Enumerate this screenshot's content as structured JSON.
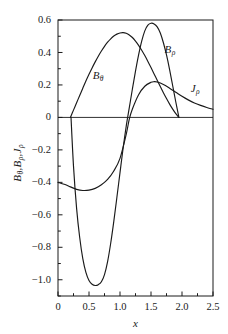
{
  "chart_data": {
    "type": "line",
    "title": "",
    "xlabel": "x",
    "ylabel": "Bθ, Bρ, Jρ",
    "xlim": [
      0,
      2.5
    ],
    "ylim": [
      -1.1,
      0.6
    ],
    "grid": false,
    "legend_position": "inline-annotations",
    "xticks": [
      "0",
      "0.5",
      "1.0",
      "1.5",
      "2.0",
      "2.5"
    ],
    "xtick_values": [
      0,
      0.5,
      1.0,
      1.5,
      2.0,
      2.5
    ],
    "yticks": [
      "0.6",
      "0.4",
      "0.2",
      "0",
      "−0.2",
      "−0.4",
      "−0.6",
      "−0.8",
      "−1.0"
    ],
    "ytick_values": [
      0.6,
      0.4,
      0.2,
      0,
      -0.2,
      -0.4,
      -0.6,
      -0.8,
      -1.0
    ],
    "zero_line": 0,
    "series": [
      {
        "name": "Bθ",
        "label_base": "B",
        "label_sub": "θ",
        "color": "#1a1a1a",
        "x": [
          0.2,
          0.25,
          0.3,
          0.35,
          0.4,
          0.45,
          0.5,
          0.55,
          0.6,
          0.65,
          0.7,
          0.75,
          0.8,
          0.85,
          0.9,
          0.95,
          1.0,
          1.05,
          1.1,
          1.15,
          1.2,
          1.25,
          1.3,
          1.35,
          1.4,
          1.45,
          1.5,
          1.55,
          1.6,
          1.65,
          1.7,
          1.75,
          1.8,
          1.85,
          1.9,
          1.95
        ],
        "y": [
          0.0,
          0.045,
          0.09,
          0.135,
          0.18,
          0.224,
          0.266,
          0.305,
          0.342,
          0.377,
          0.409,
          0.438,
          0.463,
          0.484,
          0.501,
          0.513,
          0.52,
          0.522,
          0.518,
          0.508,
          0.492,
          0.47,
          0.444,
          0.414,
          0.381,
          0.345,
          0.307,
          0.268,
          0.229,
          0.19,
          0.152,
          0.116,
          0.082,
          0.051,
          0.023,
          0.0
        ]
      },
      {
        "name": "Bρ",
        "label_base": "B",
        "label_sub": "ρ",
        "color": "#1a1a1a",
        "x": [
          0.0,
          0.1,
          0.2,
          0.3,
          0.4,
          0.5,
          0.6,
          0.7,
          0.8,
          0.9,
          1.0,
          1.1,
          1.15,
          1.2,
          1.3,
          1.4,
          1.5,
          1.55,
          1.6,
          1.7,
          1.8,
          1.9,
          2.0,
          2.1,
          2.2,
          2.3,
          2.4,
          2.5
        ],
        "y": [
          -0.4,
          -0.412,
          -0.428,
          -0.443,
          -0.45,
          -0.448,
          -0.437,
          -0.415,
          -0.382,
          -0.33,
          -0.252,
          -0.105,
          -0.01,
          0.052,
          0.14,
          0.192,
          0.216,
          0.22,
          0.218,
          0.203,
          0.18,
          0.155,
          0.13,
          0.108,
          0.089,
          0.074,
          0.061,
          0.05
        ]
      },
      {
        "name": "Jρ",
        "label_base": "J",
        "label_sub": "ρ",
        "color": "#1a1a1a",
        "x": [
          0.21,
          0.25,
          0.3,
          0.35,
          0.4,
          0.45,
          0.5,
          0.55,
          0.6,
          0.65,
          0.7,
          0.75,
          0.8,
          0.85,
          0.9,
          0.95,
          1.0,
          1.05,
          1.1,
          1.15,
          1.2,
          1.25,
          1.3,
          1.35,
          1.4,
          1.45,
          1.5,
          1.55,
          1.6,
          1.65,
          1.7,
          1.75,
          1.8,
          1.85,
          1.9,
          1.95
        ],
        "y": [
          0.0,
          -0.3,
          -0.56,
          -0.74,
          -0.87,
          -0.955,
          -1.005,
          -1.028,
          -1.035,
          -1.03,
          -1.012,
          -0.968,
          -0.888,
          -0.775,
          -0.64,
          -0.492,
          -0.34,
          -0.19,
          -0.055,
          0.06,
          0.175,
          0.285,
          0.385,
          0.47,
          0.533,
          0.568,
          0.58,
          0.576,
          0.558,
          0.52,
          0.46,
          0.385,
          0.295,
          0.195,
          0.095,
          0.0
        ]
      }
    ],
    "annotations": [
      {
        "text": "Bθ",
        "x": 0.56,
        "y": 0.255
      },
      {
        "text": "Jρ",
        "x": 1.72,
        "y": 0.415
      },
      {
        "text": "Bρ",
        "x": 2.14,
        "y": 0.175
      }
    ]
  },
  "axes": {
    "x_title": "x",
    "y_title_parts": [
      {
        "base": "B",
        "sub": "θ",
        "sep": ","
      },
      {
        "base": "B",
        "sub": "ρ",
        "sep": ","
      },
      {
        "base": "J",
        "sub": "ρ",
        "sep": ""
      }
    ]
  },
  "style": {
    "axis_color": "#1a1a1a",
    "curve_color": "#1a1a1a",
    "background": "#ffffff"
  }
}
